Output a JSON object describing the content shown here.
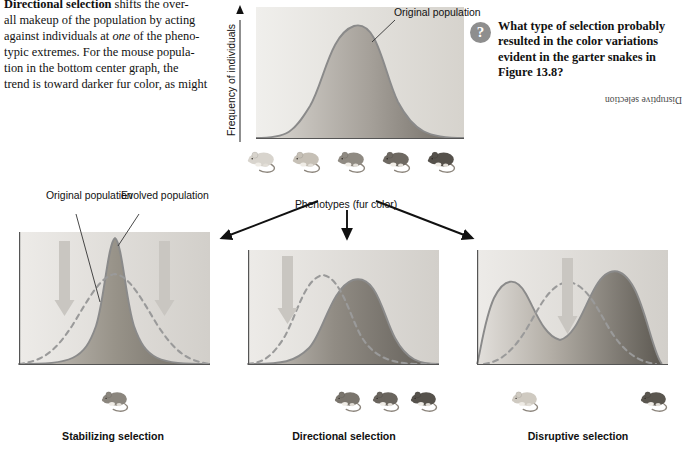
{
  "body_text": {
    "lines": [
      {
        "segments": [
          {
            "text": "Directional selection",
            "style": "bold"
          },
          {
            "text": " shifts the over-",
            "style": "plain"
          }
        ]
      },
      {
        "segments": [
          {
            "text": "all makeup of the population by acting",
            "style": "plain"
          }
        ]
      },
      {
        "segments": [
          {
            "text": "against individuals at ",
            "style": "plain"
          },
          {
            "text": "one",
            "style": "italic"
          },
          {
            "text": " of the pheno-",
            "style": "plain"
          }
        ]
      },
      {
        "segments": [
          {
            "text": "typic extremes. For the mouse popula-",
            "style": "plain"
          }
        ]
      },
      {
        "segments": [
          {
            "text": "tion in the bottom center graph, the",
            "style": "plain"
          }
        ]
      },
      {
        "segments": [
          {
            "text": "trend is toward darker fur color, as might",
            "style": "plain"
          }
        ]
      }
    ]
  },
  "question": {
    "icon": "question-mark",
    "text": "What type of selection probably resulted in the color variations evident in the garter snakes in Figure 13.8?",
    "answer": "Disruptive selection"
  },
  "top_graph": {
    "y_axis_label": "Frequency of individuals",
    "x_axis_label": "Phenotypes (fur color)",
    "curve_label": "Original population",
    "mice_count": 5,
    "mice_shades": [
      "#d8d4cd",
      "#c6c0b6",
      "#8f8a82",
      "#6e6962",
      "#55514b"
    ]
  },
  "panels": [
    {
      "id": "stabilizing",
      "caption": "Stabilizing selection",
      "labels": [
        "Original population",
        "Evolved population"
      ],
      "arrows": 2,
      "arrow_positions": [
        "left",
        "right"
      ],
      "mice_count": 1,
      "mice_shades": [
        "#8b867e"
      ]
    },
    {
      "id": "directional",
      "caption": "Directional selection",
      "labels": [],
      "arrows": 1,
      "arrow_positions": [
        "left"
      ],
      "mice_count": 3,
      "mice_shades": [
        "#7a756d",
        "#6a655e",
        "#56524c"
      ]
    },
    {
      "id": "disruptive",
      "caption": "Disruptive selection",
      "labels": [],
      "arrows": 1,
      "arrow_positions": [
        "center"
      ],
      "mice_count": 2,
      "mice_shades": [
        "#cfcac1",
        "#5a564f"
      ]
    }
  ],
  "colors": {
    "curve_line": "#8a8a8a",
    "dashed_curve": "#9a9a9a",
    "fill_light": "#e4e2de",
    "fill_dark": "#6f6b65",
    "panel_bg_light": "#eceae6",
    "panel_bg_dark": "#cfccc7",
    "arrow_gray": "#c9c6c1",
    "connector_arrow": "#111111",
    "axis": "#555555"
  },
  "chart_data": {
    "type": "line",
    "xlabel": "Phenotypes (fur color)",
    "ylabel": "Frequency of individuals",
    "grid": false,
    "legend": [
      "Original population",
      "Evolved population"
    ],
    "charts": [
      {
        "id": "original",
        "name": "Original population",
        "x": [
          0,
          10,
          20,
          30,
          40,
          50,
          60,
          70,
          80,
          90,
          100
        ],
        "y": [
          1,
          3,
          9,
          26,
          58,
          88,
          97,
          78,
          40,
          13,
          3
        ],
        "curve": "normal",
        "mean": 55,
        "sd": 18
      },
      {
        "id": "stabilizing",
        "name": "Stabilizing selection",
        "original_y": [
          2,
          8,
          22,
          48,
          76,
          92,
          76,
          48,
          22,
          8,
          2
        ],
        "evolved_y": [
          0,
          0,
          1,
          6,
          38,
          97,
          38,
          6,
          1,
          0,
          0
        ],
        "x": [
          0,
          10,
          20,
          30,
          40,
          50,
          60,
          70,
          80,
          90,
          100
        ],
        "arrow_x": [
          22,
          78
        ],
        "arrow_direction": "down"
      },
      {
        "id": "directional",
        "name": "Directional selection",
        "original_y": [
          3,
          14,
          42,
          78,
          96,
          80,
          48,
          22,
          9,
          3,
          1
        ],
        "evolved_y": [
          0,
          1,
          4,
          16,
          44,
          78,
          95,
          88,
          60,
          28,
          8
        ],
        "x": [
          0,
          10,
          20,
          30,
          40,
          50,
          60,
          70,
          80,
          90,
          100
        ],
        "arrow_x": [
          22
        ],
        "arrow_direction": "down"
      },
      {
        "id": "disruptive",
        "name": "Disruptive selection",
        "original_y": [
          2,
          10,
          32,
          66,
          92,
          97,
          84,
          56,
          28,
          10,
          3
        ],
        "evolved_y": [
          6,
          62,
          88,
          52,
          22,
          16,
          34,
          74,
          95,
          60,
          10
        ],
        "x": [
          0,
          10,
          20,
          30,
          40,
          50,
          60,
          70,
          80,
          90,
          100
        ],
        "arrow_x": [
          50
        ],
        "arrow_direction": "down"
      }
    ]
  }
}
